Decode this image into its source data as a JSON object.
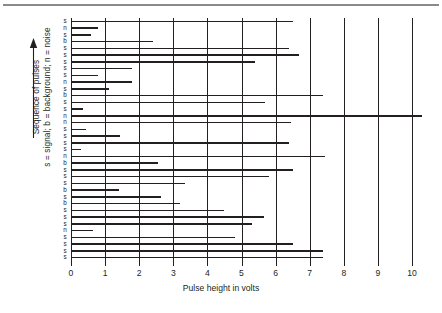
{
  "figure": {
    "caption_rule": true
  },
  "chart_data": {
    "type": "bar",
    "orientation": "horizontal",
    "title": "",
    "xlabel": "Pulse height in volts",
    "ylabel": "Sequence of pulses",
    "ylabel_legend": "s = signal; b = background; n = noise",
    "xlim": [
      0,
      10
    ],
    "xticks": [
      0,
      1,
      2,
      3,
      4,
      5,
      6,
      7,
      8,
      9,
      10
    ],
    "xticklabels": [
      "0",
      "1",
      "2",
      "3",
      "4",
      "5",
      "6",
      "7",
      "8",
      "9",
      "10"
    ],
    "grid": "vertical-only",
    "legend": "none",
    "y_arrow_direction": "up",
    "category_key": {
      "s": "signal",
      "b": "background",
      "n": "noise"
    },
    "categories": [
      "s",
      "n",
      "s",
      "b",
      "s",
      "s",
      "s",
      "s",
      "s",
      "n",
      "s",
      "b",
      "s",
      "s",
      "n",
      "n",
      "s",
      "s",
      "s",
      "s",
      "n",
      "b",
      "s",
      "s",
      "s",
      "b",
      "s",
      "b",
      "s",
      "s",
      "s",
      "n",
      "s",
      "s",
      "s",
      "s"
    ],
    "values": [
      6.5,
      0.8,
      0.6,
      2.4,
      6.4,
      6.7,
      5.4,
      1.8,
      0.8,
      1.8,
      1.1,
      7.4,
      5.7,
      0.35,
      10.3,
      6.45,
      0.45,
      1.45,
      6.4,
      0.3,
      7.45,
      2.55,
      6.5,
      5.8,
      3.35,
      1.4,
      2.65,
      3.2,
      4.5,
      5.65,
      5.3,
      0.65,
      4.8,
      6.5,
      7.4,
      7.4
    ]
  }
}
